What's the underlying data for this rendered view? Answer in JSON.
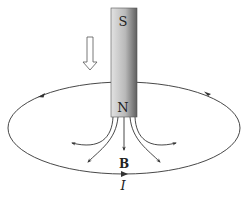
{
  "figure": {
    "type": "diagram",
    "magnet": {
      "top_pole_label": "S",
      "bottom_pole_label": "N"
    },
    "motion_arrow": {
      "icon": "hollow-down-arrow",
      "meaning": "magnet moves downward"
    },
    "field_label": "B",
    "current_label": "I",
    "colors": {
      "line": "#333333",
      "magnet_light": "#d8d8d8",
      "magnet_dark": "#6a6a6a",
      "background": "#ffffff"
    }
  }
}
